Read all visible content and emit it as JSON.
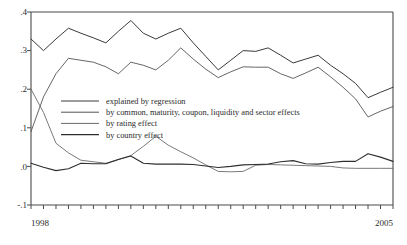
{
  "chart_data": {
    "type": "line",
    "title": "",
    "subtitle": "",
    "xlabel": "",
    "ylabel": "",
    "xlim": [
      1998.0,
      2005.25
    ],
    "ylim": [
      -0.1,
      0.4
    ],
    "grid": false,
    "legend_position": "inside-left-middle",
    "y_ticks": [
      -0.1,
      0.0,
      0.1,
      0.2,
      0.3,
      0.4
    ],
    "y_tick_labels": [
      "-.1",
      ".0",
      ".1",
      ".2",
      ".3",
      ".4"
    ],
    "x_ticks": [
      1998.0,
      1998.25,
      1998.5,
      1998.75,
      1999.0,
      1999.25,
      1999.5,
      1999.75,
      2000.0,
      2000.25,
      2000.5,
      2000.75,
      2001.0,
      2001.25,
      2001.5,
      2001.75,
      2002.0,
      2002.25,
      2002.5,
      2002.75,
      2003.0,
      2003.25,
      2003.5,
      2003.75,
      2004.0,
      2004.25,
      2004.5,
      2004.75,
      2005.0,
      2005.25
    ],
    "x_tick_labels": [
      "1998",
      "",
      "",
      "",
      "",
      "",
      "",
      "",
      "",
      "",
      "",
      "",
      "",
      "",
      "",
      "",
      "",
      "",
      "",
      "",
      "",
      "",
      "",
      "",
      "",
      "",
      "",
      "",
      "",
      "2005"
    ],
    "x": [
      1998.0,
      1998.25,
      1998.5,
      1998.75,
      1999.0,
      1999.25,
      1999.5,
      1999.75,
      2000.0,
      2000.25,
      2000.5,
      2000.75,
      2001.0,
      2001.25,
      2001.5,
      2001.75,
      2002.0,
      2002.25,
      2002.5,
      2002.75,
      2003.0,
      2003.25,
      2003.5,
      2003.75,
      2004.0,
      2004.25,
      2004.5,
      2004.75,
      2005.0,
      2005.25
    ],
    "series": [
      {
        "name": "explained by regression",
        "color": "#3a3a3a",
        "width": 1.0,
        "values": [
          0.33,
          0.3,
          0.33,
          0.358,
          0.345,
          0.333,
          0.32,
          0.35,
          0.378,
          0.345,
          0.33,
          0.345,
          0.358,
          0.32,
          0.285,
          0.25,
          0.275,
          0.3,
          0.298,
          0.307,
          0.288,
          0.268,
          0.278,
          0.288,
          0.262,
          0.24,
          0.215,
          0.178,
          0.192,
          0.205
        ]
      },
      {
        "name": "by common, maturity, coupon, liquidity and sector effects",
        "color": "#555555",
        "width": 0.9,
        "values": [
          0.09,
          0.18,
          0.24,
          0.28,
          0.275,
          0.27,
          0.258,
          0.24,
          0.27,
          0.262,
          0.25,
          0.275,
          0.307,
          0.278,
          0.252,
          0.23,
          0.245,
          0.258,
          0.257,
          0.257,
          0.24,
          0.228,
          0.242,
          0.257,
          0.232,
          0.205,
          0.175,
          0.128,
          0.143,
          0.155
        ]
      },
      {
        "name": "by rating effect",
        "color": "#6a6a6a",
        "width": 0.9,
        "values": [
          0.2,
          0.14,
          0.06,
          0.035,
          0.016,
          0.012,
          0.008,
          0.018,
          0.028,
          0.052,
          0.078,
          0.055,
          0.038,
          0.022,
          0.004,
          -0.013,
          -0.014,
          -0.013,
          0.003,
          0.005,
          0.004,
          0.003,
          0.002,
          0.001,
          0.0,
          -0.004,
          -0.005,
          -0.005,
          -0.005,
          -0.005
        ]
      },
      {
        "name": "by country effect",
        "color": "#2e2e2e",
        "width": 1.1,
        "values": [
          0.008,
          -0.002,
          -0.011,
          -0.006,
          0.008,
          0.007,
          0.007,
          0.018,
          0.027,
          0.008,
          0.006,
          0.006,
          0.006,
          0.005,
          0.001,
          -0.003,
          0.0,
          0.004,
          0.005,
          0.006,
          0.012,
          0.015,
          0.007,
          0.006,
          0.01,
          0.013,
          0.013,
          0.033,
          0.024,
          0.013
        ]
      }
    ]
  },
  "axis": {
    "y_label_0": ".4",
    "y_label_1": ".3",
    "y_label_2": ".2",
    "y_label_3": ".1",
    "y_label_4": ".0",
    "y_label_5": "-.1",
    "x_label_start": "1998",
    "x_label_end": "2005"
  },
  "legend": {
    "items": [
      {
        "label": "explained by regression"
      },
      {
        "label": "by common, maturity, coupon, liquidity and sector effects"
      },
      {
        "label": "by rating effect"
      },
      {
        "label": "by country effect"
      }
    ]
  },
  "style": {
    "frame_color": "#4a4a4a",
    "background": "#ffffff"
  }
}
